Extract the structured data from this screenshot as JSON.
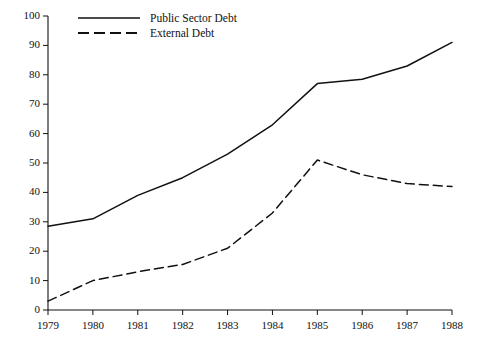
{
  "chart_data": {
    "type": "line",
    "title": "",
    "subtitle": "",
    "xlabel": "",
    "ylabel": "",
    "x": [
      1979,
      1980,
      1981,
      1982,
      1983,
      1984,
      1985,
      1986,
      1987,
      1988
    ],
    "categories": [
      "1979",
      "1980",
      "1981",
      "1982",
      "1983",
      "1984",
      "1985",
      "1986",
      "1987",
      "1988"
    ],
    "series": [
      {
        "name": "Public Sector Debt",
        "style": "solid",
        "color": "#111111",
        "values": [
          28.5,
          31,
          39,
          45,
          53,
          63,
          77,
          78.5,
          83,
          91
        ]
      },
      {
        "name": "External Debt",
        "style": "dashed",
        "color": "#111111",
        "values": [
          3,
          10,
          13,
          15.5,
          21,
          33,
          51,
          46,
          43,
          42
        ]
      }
    ],
    "xlim": [
      1979,
      1988
    ],
    "ylim": [
      0,
      100
    ],
    "yticks": [
      0,
      10,
      20,
      30,
      40,
      50,
      60,
      70,
      80,
      90,
      100
    ],
    "ytick_labels": [
      "0",
      "10",
      "20",
      "30",
      "40",
      "50",
      "60",
      "70",
      "80",
      "90",
      "100"
    ],
    "xticks": [
      1979,
      1980,
      1981,
      1982,
      1983,
      1984,
      1985,
      1986,
      1987,
      1988
    ],
    "xtick_labels": [
      "1979",
      "1980",
      "1981",
      "1982",
      "1983",
      "1984",
      "1985",
      "1986",
      "1987",
      "1988"
    ],
    "grid": false,
    "legend_position": "top-left-inside",
    "legend": [
      {
        "label": "Public Sector Debt",
        "style": "solid"
      },
      {
        "label": "External Debt",
        "style": "dashed"
      }
    ],
    "axis_color": "#111111",
    "background": "#ffffff"
  }
}
